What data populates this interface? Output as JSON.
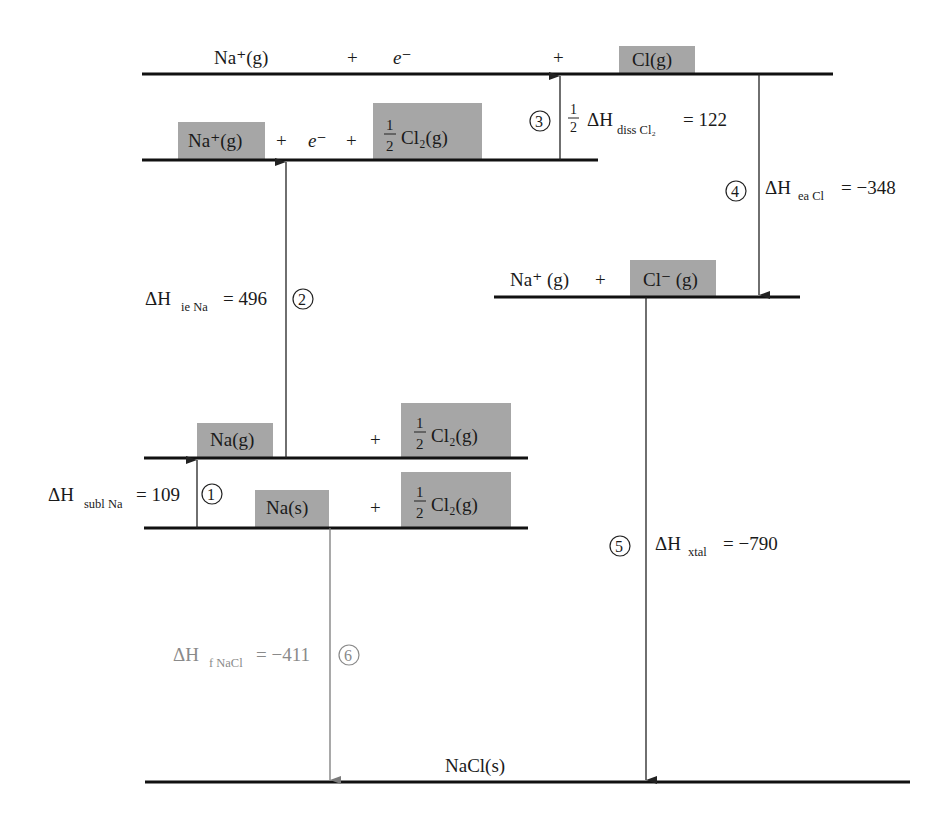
{
  "levels": {
    "top": {
      "na_ion": "Na⁺(g)",
      "plus1": "+",
      "electron": "e⁻",
      "plus2": "+",
      "cl_atom": "Cl(g)"
    },
    "ionized": {
      "na_ion": "Na⁺(g)",
      "plus1": "+",
      "electron": "e⁻",
      "plus2": "+",
      "half": "1",
      "half_den": "2",
      "cl2": "Cl₂(g)"
    },
    "ions": {
      "na_ion": "Na⁺ (g)",
      "plus": "+",
      "cl_ion": "Cl⁻ (g)"
    },
    "gas_atom": {
      "na_gas": "Na(g)",
      "plus": "+",
      "half": "1",
      "half_den": "2",
      "cl2": "Cl₂(g)"
    },
    "elements": {
      "na_solid": "Na(s)",
      "plus": "+",
      "half": "1",
      "half_den": "2",
      "cl2": "Cl₂(g)"
    },
    "product": {
      "nacl": "NaCl(s)"
    }
  },
  "steps": [
    {
      "num": "1",
      "label": "ΔH",
      "sub": "subl Na",
      "value": "= 109"
    },
    {
      "num": "2",
      "label": "ΔH",
      "sub": "ie Na",
      "value": "= 496"
    },
    {
      "num": "3",
      "prefix_num": "1",
      "prefix_den": "2",
      "label": "ΔH",
      "sub": "diss Cl₂",
      "value": "= 122"
    },
    {
      "num": "4",
      "label": "ΔH",
      "sub": "ea Cl",
      "value": "= −348"
    },
    {
      "num": "5",
      "label": "ΔH",
      "sub": "xtal",
      "value": "= −790"
    },
    {
      "num": "6",
      "label": "ΔH",
      "sub": "f NaCl",
      "value": "= −411"
    }
  ],
  "colors": {
    "box_fill": "#a6a6a6",
    "line": "#111111",
    "formation_path": "#8a8a8a"
  }
}
